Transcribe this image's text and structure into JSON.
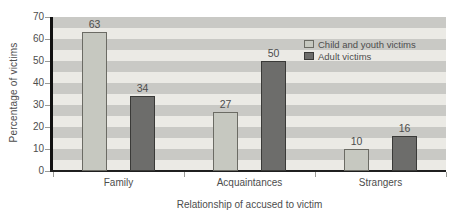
{
  "figure": {
    "background": "#ffffff",
    "text_color": "#4d4d4d",
    "axis_color": "#111111"
  },
  "chart_data": {
    "type": "bar",
    "title": "",
    "categories": [
      "Family",
      "Acquaintances",
      "Strangers"
    ],
    "series": [
      {
        "name": "Child and youth victims",
        "values": [
          63,
          27,
          10
        ],
        "fill": "#c6c8c0",
        "border": "#6b6b64"
      },
      {
        "name": "Adult victims",
        "values": [
          34,
          50,
          16
        ],
        "fill": "#6d6d6b",
        "border": "#3a3a38"
      }
    ],
    "value_labels": [
      63,
      34,
      27,
      50,
      10,
      16
    ],
    "xlabel": "Relationship of accused to victim",
    "ylabel": "Percentage of victims",
    "ylim": [
      0,
      70
    ],
    "yticks": [
      0,
      10,
      20,
      30,
      40,
      50,
      60,
      70
    ],
    "grid": "horizontal-striped-bands",
    "band_units": 5,
    "stripe_colors": [
      "#c9c9c5",
      "#ebeae5"
    ],
    "legend_position": "top-right",
    "legend_entries": [
      "Child and youth victims",
      "Adult victims"
    ]
  }
}
